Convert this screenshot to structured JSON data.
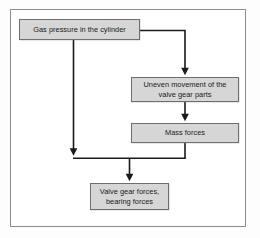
{
  "diagram": {
    "type": "flowchart",
    "background_color": "#ffffff",
    "frame_color": "#8d8d8d",
    "node_fill_color": "#d6d6d6",
    "node_border_color": "#6e6e6e",
    "connector_color": "#1a1a1a",
    "nodes": [
      {
        "id": "gas-pressure",
        "label": "Gas pressure in the cylinder",
        "lines": [
          "Gas pressure in the cylinder"
        ]
      },
      {
        "id": "uneven-movement",
        "label": "Uneven movement of the valve gear parts",
        "lines": [
          "Uneven movement of the",
          "valve gear parts"
        ]
      },
      {
        "id": "mass-forces",
        "label": "Mass forces",
        "lines": [
          "Mass forces"
        ]
      },
      {
        "id": "valve-gear-forces",
        "label": "Valve gear forces, bearing forces",
        "lines": [
          "Valve gear forces,",
          "bearing forces"
        ]
      }
    ],
    "connectors": [
      {
        "id": "gas-to-uneven",
        "from": "gas-pressure",
        "to": "uneven-movement",
        "style": "elbow-right-down",
        "arrow": true
      },
      {
        "id": "gas-to-bus",
        "from": "gas-pressure",
        "to": "bus",
        "style": "straight-down",
        "arrow": true
      },
      {
        "id": "uneven-to-mass",
        "from": "uneven-movement",
        "to": "mass-forces",
        "style": "straight-down",
        "arrow": true
      },
      {
        "id": "mass-to-bus",
        "from": "mass-forces",
        "to": "bus",
        "style": "straight-down",
        "arrow": false
      },
      {
        "id": "bus-to-valve-gear",
        "from": "bus",
        "to": "valve-gear-forces",
        "style": "straight-down",
        "arrow": true
      }
    ]
  }
}
